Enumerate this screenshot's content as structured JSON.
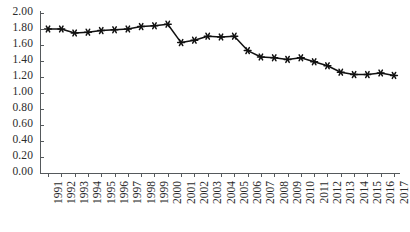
{
  "chart_data": {
    "type": "line",
    "title": "",
    "xlabel": "",
    "ylabel": "",
    "grid": false,
    "legend": "none",
    "marker": "asterisk",
    "line_color": "#111111",
    "ylim": [
      0.0,
      2.0
    ],
    "ytick_step": 0.2,
    "ytick_labels": [
      "0.00",
      "0.20",
      "0.40",
      "0.60",
      "0.80",
      "1.00",
      "1.20",
      "1.40",
      "1.60",
      "1.80",
      "2.00"
    ],
    "ytick_values": [
      0.0,
      0.2,
      0.4,
      0.6,
      0.8,
      1.0,
      1.2,
      1.4,
      1.6,
      1.8,
      2.0
    ],
    "categories": [
      "1991",
      "1992",
      "1993",
      "1994",
      "1995",
      "1996",
      "1997",
      "1998",
      "1999",
      "2000",
      "2001",
      "2002",
      "2003",
      "2004",
      "2005",
      "2006",
      "2007",
      "2008",
      "2009",
      "2010",
      "2011",
      "2012",
      "2013",
      "2014",
      "2015",
      "2016",
      "2017"
    ],
    "values": [
      1.8,
      1.8,
      1.75,
      1.76,
      1.78,
      1.79,
      1.8,
      1.83,
      1.84,
      1.86,
      1.63,
      1.66,
      1.71,
      1.7,
      1.71,
      1.53,
      1.45,
      1.44,
      1.42,
      1.44,
      1.39,
      1.34,
      1.26,
      1.23,
      1.23,
      1.25,
      1.22
    ]
  }
}
